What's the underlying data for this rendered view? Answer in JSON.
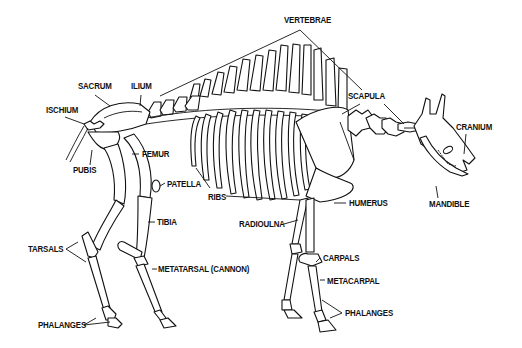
{
  "diagram": {
    "colors": {
      "background": "#ffffff",
      "ink": "#111111"
    },
    "labels": {
      "vertebrae": {
        "text": "VERTEBRAE",
        "x": 284,
        "y": 20
      },
      "sacrum": {
        "text": "SACRUM",
        "x": 78,
        "y": 86
      },
      "ilium": {
        "text": "ILIUM",
        "x": 131,
        "y": 86
      },
      "scapula": {
        "text": "SCAPULA",
        "x": 348,
        "y": 95
      },
      "ischium": {
        "text": "ISCHIUM",
        "x": 46,
        "y": 108
      },
      "cranium": {
        "text": "CRANIUM",
        "x": 456,
        "y": 124
      },
      "femur": {
        "text": "FEMUR",
        "x": 142,
        "y": 150
      },
      "pubis": {
        "text": "PUBIS",
        "x": 73,
        "y": 168
      },
      "mandible": {
        "text": "MANDIBLE",
        "x": 429,
        "y": 201
      },
      "humerus": {
        "text": "HUMERUS",
        "x": 349,
        "y": 199
      },
      "patella": {
        "text": "PATELLA",
        "x": 167,
        "y": 181
      },
      "ribs": {
        "text": "RIBS",
        "x": 208,
        "y": 193
      },
      "radioulna": {
        "text": "RADIOULNA",
        "x": 239,
        "y": 221
      },
      "tibia": {
        "text": "TIBIA",
        "x": 157,
        "y": 218
      },
      "tarsals": {
        "text": "TARSALS",
        "x": 28,
        "y": 244
      },
      "carpals": {
        "text": "CARPALS",
        "x": 323,
        "y": 253
      },
      "metatarsal": {
        "text": "METATARSAL  (CANNON)",
        "x": 158,
        "y": 265
      },
      "metacarpal": {
        "text": "METACARPAL",
        "x": 327,
        "y": 276
      },
      "phalanges_hind": {
        "text": "PHALANGES",
        "x": 38,
        "y": 321
      },
      "phalanges_fore": {
        "text": "PHALANGES",
        "x": 345,
        "y": 309
      }
    }
  }
}
